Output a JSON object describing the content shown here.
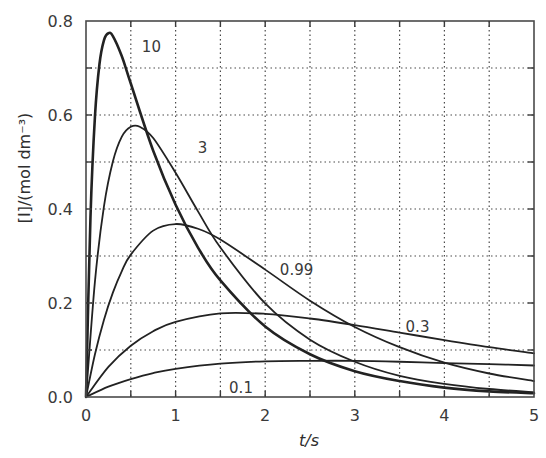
{
  "chart_data": {
    "type": "line",
    "title": "",
    "xlabel": "t/s",
    "ylabel": "[I]/(mol dm⁻³)",
    "xlim": [
      0,
      5
    ],
    "ylim": [
      0,
      0.8
    ],
    "x_ticks": [
      "0",
      "1",
      "2",
      "3",
      "4",
      "5"
    ],
    "y_ticks": [
      "0.0",
      "0.2",
      "0.4",
      "0.6",
      "0.8"
    ],
    "grid": true,
    "grid_style": "dotted",
    "legend": "inline curve labels",
    "series": [
      {
        "name": "10",
        "label_pos": [
          0.73,
          0.745
        ],
        "stroke_width": 2.6,
        "x": [
          0,
          0.05,
          0.1,
          0.15,
          0.2,
          0.25,
          0.3,
          0.4,
          0.5,
          0.75,
          1,
          1.25,
          1.5,
          2,
          2.5,
          3,
          3.5,
          4,
          4.5,
          5
        ],
        "values": [
          0,
          0.383,
          0.597,
          0.708,
          0.759,
          0.774,
          0.768,
          0.725,
          0.667,
          0.524,
          0.409,
          0.318,
          0.248,
          0.15,
          0.091,
          0.055,
          0.034,
          0.02,
          0.012,
          0.008
        ]
      },
      {
        "name": "3",
        "label_pos": [
          1.3,
          0.53
        ],
        "stroke_width": 1.8,
        "x": [
          0,
          0.1,
          0.2,
          0.3,
          0.4,
          0.5,
          0.6,
          0.75,
          1,
          1.25,
          1.5,
          2,
          2.5,
          3,
          3.5,
          4,
          4.5,
          5
        ],
        "values": [
          0,
          0.246,
          0.405,
          0.501,
          0.554,
          0.575,
          0.575,
          0.551,
          0.477,
          0.395,
          0.318,
          0.199,
          0.122,
          0.075,
          0.045,
          0.028,
          0.017,
          0.01
        ]
      },
      {
        "name": "0.99",
        "label_pos": [
          2.35,
          0.27
        ],
        "stroke_width": 1.8,
        "x": [
          0,
          0.1,
          0.2,
          0.3,
          0.4,
          0.5,
          0.75,
          1,
          1.25,
          1.5,
          2,
          2.5,
          3,
          3.5,
          4,
          4.5,
          5
        ],
        "values": [
          0,
          0.091,
          0.164,
          0.222,
          0.268,
          0.303,
          0.354,
          0.368,
          0.358,
          0.335,
          0.271,
          0.205,
          0.149,
          0.106,
          0.073,
          0.05,
          0.034
        ]
      },
      {
        "name": "0.3",
        "label_pos": [
          3.7,
          0.15
        ],
        "stroke_width": 1.8,
        "x": [
          0,
          0.25,
          0.5,
          0.75,
          1,
          1.5,
          2,
          2.5,
          3,
          3.5,
          4,
          4.5,
          5
        ],
        "values": [
          0,
          0.064,
          0.109,
          0.14,
          0.16,
          0.178,
          0.177,
          0.167,
          0.153,
          0.137,
          0.121,
          0.106,
          0.093
        ]
      },
      {
        "name": "0.1",
        "label_pos": [
          1.73,
          0.02
        ],
        "stroke_width": 1.8,
        "x": [
          0,
          0.25,
          0.5,
          0.75,
          1,
          1.5,
          2,
          2.5,
          3,
          3.5,
          4,
          4.5,
          5
        ],
        "values": [
          0,
          0.022,
          0.038,
          0.051,
          0.06,
          0.071,
          0.076,
          0.077,
          0.077,
          0.075,
          0.072,
          0.07,
          0.067
        ]
      }
    ]
  }
}
